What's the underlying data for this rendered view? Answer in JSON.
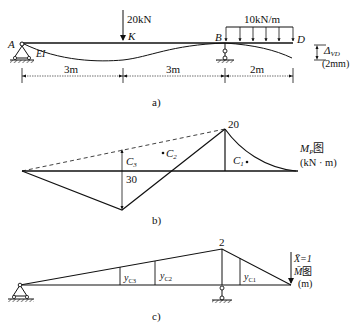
{
  "panel_a": {
    "caption": "a)",
    "load_point": "20kN",
    "load_dist": "10kN/m",
    "point_K": "K",
    "point_A": "A",
    "point_B": "B",
    "point_D": "D",
    "stiffness": "EI",
    "delta_label": "Δ",
    "delta_sub": "VD",
    "delta_value": "(2mm)",
    "dim1": "3m",
    "dim2": "3m",
    "dim3": "2m"
  },
  "panel_b": {
    "caption": "b)",
    "peak_value": "20",
    "mid_value": "30",
    "c1": "C",
    "c1_sub": "1",
    "c2": "C",
    "c2_sub": "2",
    "c3": "C",
    "c3_sub": "3",
    "title_main": "M",
    "title_sub": "P",
    "title_suffix": "图",
    "units": "(kN · m)"
  },
  "panel_c": {
    "caption": "c)",
    "peak_value": "2",
    "y1": "y",
    "y1_sub": "C1",
    "y2": "y",
    "y2_sub": "C2",
    "y3": "y",
    "y3_sub": "C3",
    "unit_load": "X̄=1",
    "title_main": "M̄",
    "title_suffix": "图",
    "units": "(m)"
  }
}
